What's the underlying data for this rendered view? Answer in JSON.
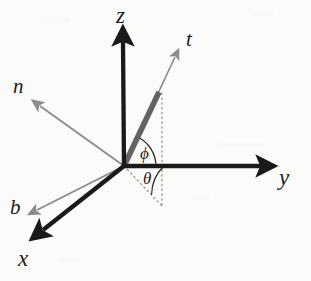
{
  "figure": {
    "type": "vector-coordinate-diagram",
    "background_color": "#fbfbfa",
    "canvas": {
      "width": 311,
      "height": 281
    },
    "origin": {
      "x": 124,
      "y": 166
    },
    "colors": {
      "axis_black": "#1a1a1a",
      "vector_gray": "#8c8c8c",
      "vector_dark_gray": "#636363",
      "dotted_gray": "#8a8a8a",
      "text": "#1a1a1a"
    },
    "axes": [
      {
        "name": "z-axis",
        "label": "z",
        "label_pos": {
          "x": 116,
          "y": 6
        },
        "from": {
          "x": 124,
          "y": 166
        },
        "to": {
          "x": 123,
          "y": 36
        },
        "color": "#1a1a1a",
        "width": 4.2,
        "arrow": "solid-black"
      },
      {
        "name": "y-axis",
        "label": "y",
        "label_pos": {
          "x": 279,
          "y": 167
        },
        "from": {
          "x": 124,
          "y": 166
        },
        "to": {
          "x": 266,
          "y": 166
        },
        "color": "#1a1a1a",
        "width": 4.2,
        "arrow": "solid-black"
      },
      {
        "name": "x-axis",
        "label": "x",
        "label_pos": {
          "x": 18,
          "y": 248
        },
        "from": {
          "x": 124,
          "y": 166
        },
        "to": {
          "x": 37,
          "y": 235
        },
        "color": "#1a1a1a",
        "width": 4.2,
        "arrow": "solid-black"
      }
    ],
    "vectors": [
      {
        "name": "t-vector",
        "label": "t",
        "label_pos": {
          "x": 186,
          "y": 30
        },
        "from": {
          "x": 124,
          "y": 166
        },
        "to": {
          "x": 176,
          "y": 55
        },
        "color": "#8c8c8c",
        "width": 1.6,
        "arrow": "thin-gray",
        "note": "tangent direction, thin gray arrow extending beyond the thick shaft"
      },
      {
        "name": "t-vector-shaft",
        "label": "",
        "from": {
          "x": 124,
          "y": 166
        },
        "to": {
          "x": 159,
          "y": 92
        },
        "color": "#636363",
        "width": 5.5,
        "arrow": "none",
        "note": "thick dark-gray segment representing unit length along t"
      },
      {
        "name": "n-vector",
        "label": "n",
        "label_pos": {
          "x": 14,
          "y": 76
        },
        "from": {
          "x": 124,
          "y": 166
        },
        "to": {
          "x": 38,
          "y": 105
        },
        "color": "#8c8c8c",
        "width": 1.8,
        "arrow": "thin-gray"
      },
      {
        "name": "b-vector",
        "label": "b",
        "label_pos": {
          "x": 10,
          "y": 198
        },
        "from": {
          "x": 124,
          "y": 166
        },
        "to": {
          "x": 34,
          "y": 211
        },
        "color": "#8c8c8c",
        "width": 1.8,
        "arrow": "thin-gray"
      }
    ],
    "guides": [
      {
        "name": "vertical-projection-line",
        "from": {
          "x": 162,
          "y": 93
        },
        "to": {
          "x": 162,
          "y": 206
        },
        "style": "dotted",
        "color": "#8a8a8a"
      },
      {
        "name": "ground-projection-line",
        "from": {
          "x": 124,
          "y": 166
        },
        "to": {
          "x": 162,
          "y": 206
        },
        "style": "dotted",
        "color": "#8a8a8a"
      }
    ],
    "angles": [
      {
        "name": "phi-angle",
        "label": "ϕ",
        "label_pos": {
          "x": 140,
          "y": 145
        },
        "radius": 32,
        "from_deg_ccw": 0,
        "to_deg_ccw": 64.7,
        "description": "angle between the y-axis and the t vector",
        "color": "#1a1a1a"
      },
      {
        "name": "theta-angle",
        "label": "θ",
        "label_pos": {
          "x": 143,
          "y": 170
        },
        "radius": 40,
        "from_deg_ccw": -46.4,
        "to_deg_ccw": 0,
        "description": "angle between the y-axis and the ground projection of t",
        "color": "#1a1a1a"
      }
    ]
  }
}
